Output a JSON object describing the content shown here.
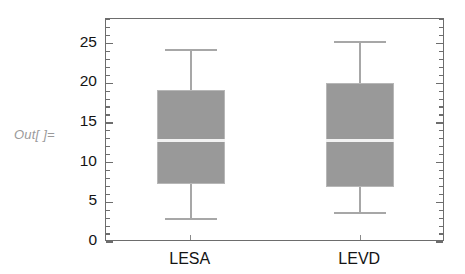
{
  "prompt": {
    "out_label": "Out[ ]="
  },
  "chart_data": {
    "type": "box",
    "title": "",
    "xlabel": "",
    "ylabel": "",
    "categories": [
      "LESA",
      "LEVD"
    ],
    "ylim": [
      0,
      28.1
    ],
    "yticks": [
      0,
      5,
      10,
      15,
      20,
      25
    ],
    "ytick_labels": [
      "0",
      "5",
      "10",
      "15",
      "20",
      "25"
    ],
    "minor_tick_step": 1,
    "grid": false,
    "legend": false,
    "frame": true,
    "box_fill_color": "#999999",
    "box_edge_color": "#b7b7b7",
    "median_color": "#f2f2f2",
    "whisker_color": "#a7a7a7",
    "axis_color": "#6d6d6d",
    "boxes": [
      {
        "label": "LESA",
        "whisker_low": 2.9,
        "q1": 7.3,
        "median": 12.8,
        "q3": 19.1,
        "whisker_high": 24.2,
        "outliers": []
      },
      {
        "label": "LEVD",
        "whisker_low": 3.7,
        "q1": 6.9,
        "median": 12.8,
        "q3": 20.0,
        "whisker_high": 25.2,
        "outliers": []
      }
    ]
  }
}
